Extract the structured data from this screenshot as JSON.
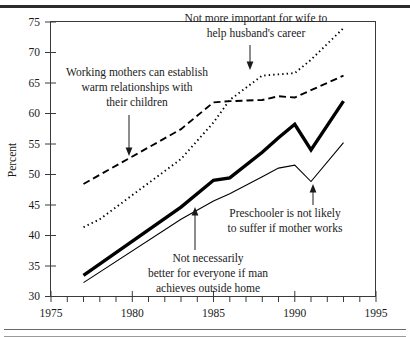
{
  "chart_data": {
    "type": "line",
    "title": "",
    "subtitle": "",
    "xlabel": "",
    "ylabel": "Percent",
    "xlim": [
      1975,
      1995
    ],
    "ylim": [
      30,
      75
    ],
    "grid": false,
    "legend_position": "none",
    "xticks": [
      1975,
      1976,
      1977,
      1978,
      1979,
      1980,
      1981,
      1982,
      1983,
      1984,
      1985,
      1986,
      1987,
      1988,
      1989,
      1990,
      1991,
      1992,
      1993,
      1994,
      1995
    ],
    "xtick_labels": [
      "1975",
      "",
      "",
      "",
      "",
      "1980",
      "",
      "",
      "",
      "",
      "1985",
      "",
      "",
      "",
      "",
      "1990",
      "",
      "",
      "",
      "",
      "1995"
    ],
    "xtick_labels_major": [
      "1975",
      "1980",
      "1985",
      "1990",
      "1995"
    ],
    "yticks": [
      30,
      35,
      40,
      45,
      50,
      55,
      60,
      65,
      70,
      75
    ],
    "ytick_labels": [
      "30",
      "35",
      "40",
      "45",
      "50",
      "55",
      "60",
      "65",
      "70",
      "75"
    ],
    "series": [
      {
        "name": "Not more important for wife to help husband's career",
        "style": "dotted",
        "x": [
          1977,
          1978,
          1983,
          1985,
          1986,
          1988,
          1989,
          1990,
          1991,
          1993
        ],
        "values": [
          41.3,
          42.6,
          52.5,
          58.5,
          62.2,
          66.2,
          66.4,
          66.6,
          68.8,
          74.0
        ]
      },
      {
        "name": "Working mothers can establish warm relationships with their children",
        "style": "dashed",
        "x": [
          1977,
          1983,
          1985,
          1986,
          1988,
          1989,
          1990,
          1991,
          1993
        ],
        "values": [
          48.4,
          57.4,
          61.8,
          62.0,
          62.2,
          62.8,
          62.6,
          63.8,
          66.2
        ]
      },
      {
        "name": "Preschooler is not likely to suffer if mother works",
        "style": "thick",
        "x": [
          1977,
          1983,
          1985,
          1986,
          1988,
          1989,
          1990,
          1991,
          1993
        ],
        "values": [
          33.4,
          44.6,
          49.0,
          49.4,
          53.6,
          56.0,
          58.2,
          54.0,
          62.0
        ]
      },
      {
        "name": "Not necessarily better for everyone if man achieves outside home",
        "style": "thin",
        "x": [
          1977,
          1983,
          1985,
          1986,
          1988,
          1989,
          1990,
          1991,
          1993
        ],
        "values": [
          32.2,
          42.6,
          45.6,
          46.8,
          49.6,
          51.0,
          51.5,
          48.8,
          55.2
        ]
      }
    ],
    "annotations": [
      {
        "id": "annot-wife-career",
        "lines": [
          "Not more important for wife to",
          "help husband's career"
        ],
        "series": "Not more important for wife to help husband's career",
        "arrow": "down"
      },
      {
        "id": "annot-working-mothers",
        "lines": [
          "Working mothers can establish",
          "warm relationships with",
          "their children"
        ],
        "series": "Working mothers can establish warm relationships with their children",
        "arrow": "down"
      },
      {
        "id": "annot-preschooler",
        "lines": [
          "Preschooler is not likely",
          "to suffer if mother works"
        ],
        "series": "Preschooler is not likely to suffer if mother works",
        "arrow": "up"
      },
      {
        "id": "annot-not-necessarily",
        "lines": [
          "Not necessarily",
          "better for everyone if man",
          "achieves outside home"
        ],
        "series": "Not necessarily better for everyone if man achieves outside home",
        "arrow": "up"
      }
    ],
    "colors": {
      "ink": "#000000",
      "axis": "#3a3a3a",
      "background": "#ffffff"
    }
  },
  "axis": {
    "ylabel": "Percent",
    "ytick_30": "30",
    "ytick_35": "35",
    "ytick_40": "40",
    "ytick_45": "45",
    "ytick_50": "50",
    "ytick_55": "55",
    "ytick_60": "60",
    "ytick_65": "65",
    "ytick_70": "70",
    "ytick_75": "75",
    "xtick_1975": "1975",
    "xtick_1980": "1980",
    "xtick_1985": "1985",
    "xtick_1990": "1990",
    "xtick_1995": "1995"
  },
  "annotations": {
    "wife_career": {
      "line1": "Not more important for wife to",
      "line2": "help husband's career"
    },
    "working_mothers": {
      "line1": "Working mothers can establish",
      "line2": "warm relationships with",
      "line3": "their children"
    },
    "preschooler": {
      "line1": "Preschooler is not likely",
      "line2": "to suffer if mother works"
    },
    "not_necessarily": {
      "line1": "Not necessarily",
      "line2": "better for everyone if man",
      "line3": "achieves outside home"
    }
  }
}
